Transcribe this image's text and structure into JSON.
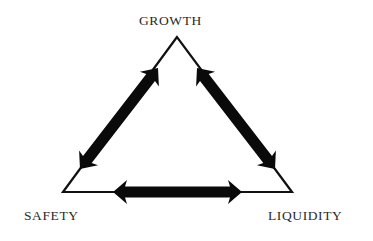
{
  "diagram": {
    "type": "triangle",
    "labels": {
      "top": "GROWTH",
      "bottom_left": "SAFETY",
      "bottom_right": "LIQUIDITY"
    },
    "vertices": {
      "top": [
        177,
        37
      ],
      "bottom_left": [
        63,
        192
      ],
      "bottom_right": [
        292,
        192
      ]
    },
    "arrows": [
      {
        "from": "SAFETY",
        "to": "GROWTH",
        "direction": "bidirectional",
        "start": [
          80,
          169
        ],
        "end": [
          158,
          68
        ]
      },
      {
        "from": "GROWTH",
        "to": "LIQUIDITY",
        "direction": "bidirectional",
        "start": [
          197,
          68
        ],
        "end": [
          275,
          169
        ]
      },
      {
        "from": "SAFETY",
        "to": "LIQUIDITY",
        "direction": "bidirectional",
        "start": [
          113,
          192
        ],
        "end": [
          242,
          192
        ]
      }
    ],
    "colors": {
      "background": "#ffffff",
      "line": "#111111",
      "arrow": "#0a0a0a",
      "text": "#2a2a2a"
    }
  }
}
